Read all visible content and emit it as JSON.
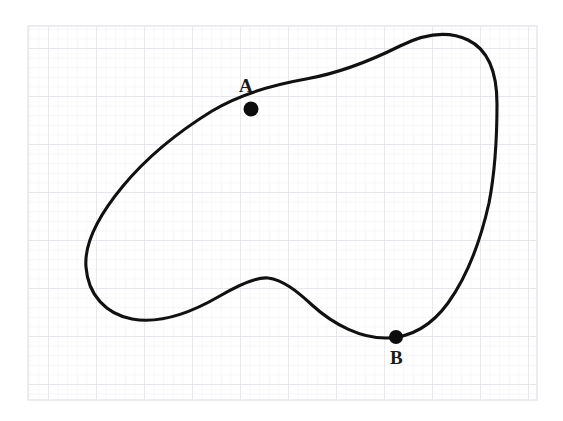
{
  "figure": {
    "background_color": "#ffffff",
    "canvas": {
      "width": 563,
      "height": 421
    }
  },
  "grid": {
    "visible": true,
    "region": {
      "x": 28,
      "y": 26,
      "width": 509,
      "height": 374
    },
    "minor_spacing_px": 9.6,
    "major_every": 5,
    "minor_color": "#ecedf1",
    "major_color": "#e1e3ea",
    "border_color": "#e4e5ea"
  },
  "curve": {
    "name": "closed-blob-curve",
    "stroke_color": "#111111",
    "stroke_width": 3.1,
    "closed": true,
    "description": "hand-drawn closed loop with a concave lower-middle indentation",
    "path": "M 497,104 C 497,72 489,50 468,40 C 447,30 424,34 400,46 C 372,60 340,73 306,79 C 272,85 240,94 212,111 C 178,132 147,157 123,186 C 99,215 84,243 86,267 C 88,295 106,314 132,319 C 160,324 192,312 218,297 C 242,283 258,277 268,278 C 283,280 297,291 312,305 C 334,325 362,339 388,338 C 412,337 432,325 448,303 C 466,278 480,243 489,203 C 495,172 497,136 497,104 Z"
  },
  "points": [
    {
      "id": "A",
      "label": "A",
      "marker": {
        "cx": 251,
        "cy": 109,
        "r": 7.5,
        "color": "#0d0d0d"
      },
      "label_position": {
        "x": 239,
        "y": 76
      }
    },
    {
      "id": "B",
      "label": "B",
      "marker": {
        "cx": 396,
        "cy": 337,
        "r": 7.0,
        "color": "#0d0d0d"
      },
      "label_position": {
        "x": 390,
        "y": 348
      }
    }
  ]
}
